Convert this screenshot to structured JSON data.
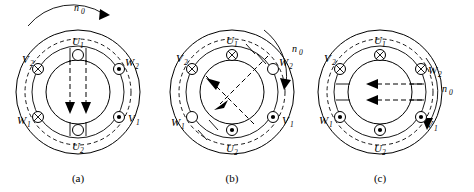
{
  "figure": {
    "panel_count": 3,
    "rotation_symbol": "n",
    "rotation_subscript": "0",
    "colors": {
      "line": "#000000",
      "background": "#ffffff"
    },
    "symbol_legend": {
      "cross": "current into page",
      "dot": "current out of page",
      "circle": "zero current"
    }
  },
  "panels": [
    {
      "id": "a",
      "caption": "(a)",
      "rotation": {
        "label": "n",
        "sub": "0",
        "position": "top",
        "direction": "clockwise"
      },
      "field": {
        "direction": "down",
        "arrows": 2
      },
      "terminals": [
        {
          "name": "U",
          "sub": "1",
          "position": "top",
          "symbol": "circle"
        },
        {
          "name": "W",
          "sub": "2",
          "position": "upper-right",
          "symbol": "dot"
        },
        {
          "name": "V",
          "sub": "1",
          "position": "lower-right",
          "symbol": "dot"
        },
        {
          "name": "U",
          "sub": "2",
          "position": "bottom",
          "symbol": "circle"
        },
        {
          "name": "W",
          "sub": "1",
          "position": "lower-left",
          "symbol": "cross"
        },
        {
          "name": "V",
          "sub": "2",
          "position": "upper-left",
          "symbol": "cross"
        }
      ]
    },
    {
      "id": "b",
      "caption": "(b)",
      "rotation": {
        "label": "n",
        "sub": "0",
        "position": "top-right",
        "direction": "clockwise"
      },
      "field": {
        "direction": "upper-left",
        "arrows": 2
      },
      "terminals": [
        {
          "name": "U",
          "sub": "1",
          "position": "top",
          "symbol": "cross"
        },
        {
          "name": "W",
          "sub": "2",
          "position": "upper-right",
          "symbol": "circle"
        },
        {
          "name": "V",
          "sub": "1",
          "position": "lower-right",
          "symbol": "dot"
        },
        {
          "name": "U",
          "sub": "2",
          "position": "bottom",
          "symbol": "dot"
        },
        {
          "name": "W",
          "sub": "1",
          "position": "lower-left",
          "symbol": "circle"
        },
        {
          "name": "V",
          "sub": "2",
          "position": "upper-left",
          "symbol": "cross"
        }
      ]
    },
    {
      "id": "c",
      "caption": "(c)",
      "rotation": {
        "label": "n",
        "sub": "0",
        "position": "right",
        "direction": "clockwise"
      },
      "field": {
        "direction": "left",
        "arrows": 2
      },
      "terminals": [
        {
          "name": "U",
          "sub": "1",
          "position": "top",
          "symbol": "cross"
        },
        {
          "name": "W",
          "sub": "2",
          "position": "upper-right",
          "symbol": "cross"
        },
        {
          "name": "V",
          "sub": "1",
          "position": "lower-right",
          "symbol": "dot"
        },
        {
          "name": "U",
          "sub": "2",
          "position": "bottom",
          "symbol": "dot"
        },
        {
          "name": "W",
          "sub": "1",
          "position": "lower-left",
          "symbol": "dot"
        },
        {
          "name": "V",
          "sub": "2",
          "position": "upper-left",
          "symbol": "cross"
        }
      ]
    }
  ]
}
